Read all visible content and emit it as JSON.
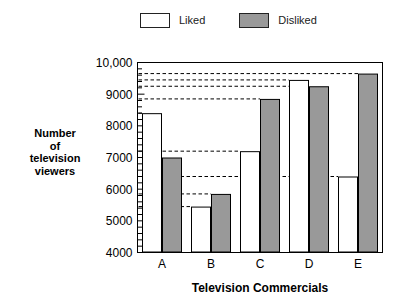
{
  "chart_data": {
    "type": "bar",
    "title": "",
    "subtitle": "",
    "xlabel": "Television Commercials",
    "ylabel": "Number of television viewers",
    "categories": [
      "A",
      "B",
      "C",
      "D",
      "E"
    ],
    "series": [
      {
        "name": "Liked",
        "values": [
          8400,
          5450,
          7200,
          9450,
          6400
        ],
        "color": "#ffffff"
      },
      {
        "name": "Disliked",
        "values": [
          7000,
          5850,
          8850,
          9250,
          9650
        ],
        "color": "#999999"
      }
    ],
    "ylim": [
      4000,
      10000
    ],
    "ytick_labels": [
      "4000",
      "5000",
      "6000",
      "7000",
      "8000",
      "9000",
      "10,000"
    ],
    "ytick_values": [
      4000,
      5000,
      6000,
      7000,
      8000,
      9000,
      10000
    ],
    "yminor_step": 200,
    "grid": false,
    "leader_lines": "dashed horizontal line from y-axis to the top of every bar",
    "legend_position": "top-center",
    "legend_entries": [
      "Liked",
      "Disliked"
    ],
    "frame": "box"
  },
  "ylabel_lines": [
    "Number",
    "of",
    "television",
    "viewers"
  ],
  "colors": {
    "liked": "#ffffff",
    "disliked": "#999999",
    "outline": "#000000",
    "background": "#ffffff"
  }
}
